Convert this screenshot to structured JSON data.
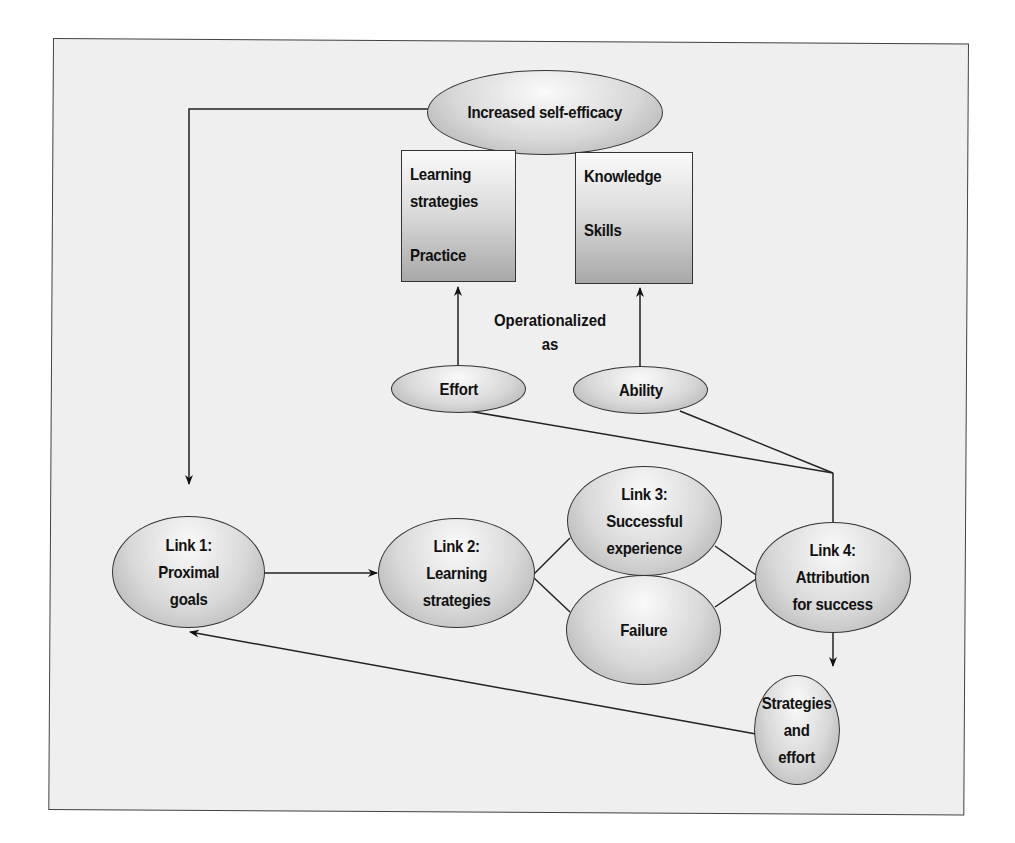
{
  "diagram": {
    "nodes": {
      "self_efficacy": "Increased self-efficacy",
      "effort_box": "Learning\nstrategies\n\nPractice",
      "ability_box": "Knowledge\n\nSkills",
      "effort": "Effort",
      "ability": "Ability",
      "link1": "Link 1:\nProximal\ngoals",
      "link2": "Link 2:\nLearning\nstrategies",
      "link3": "Link 3:\nSuccessful\nexperience",
      "failure": "Failure",
      "link4": "Link 4:\nAttribution\nfor success",
      "strategies_effort": "Strategies\nand\neffort"
    },
    "annotation": "Operationalized\nas",
    "edges": [
      {
        "from": "self_efficacy",
        "to": "link1",
        "arrow": true
      },
      {
        "from": "effort",
        "to": "effort_box",
        "arrow": true
      },
      {
        "from": "ability",
        "to": "ability_box",
        "arrow": true
      },
      {
        "from": "effort",
        "to": "link4",
        "arrow": false
      },
      {
        "from": "ability",
        "to": "link4",
        "arrow": false
      },
      {
        "from": "link1",
        "to": "link2",
        "arrow": true
      },
      {
        "from": "link2",
        "to": "link3",
        "arrow": false
      },
      {
        "from": "link2",
        "to": "failure",
        "arrow": false
      },
      {
        "from": "link3",
        "to": "link4",
        "arrow": false
      },
      {
        "from": "failure",
        "to": "link4",
        "arrow": false
      },
      {
        "from": "link4",
        "to": "strategies_effort",
        "arrow": true
      },
      {
        "from": "strategies_effort",
        "to": "link1",
        "arrow": true
      }
    ]
  }
}
